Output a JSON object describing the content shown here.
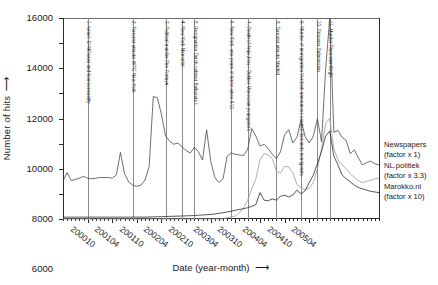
{
  "chart_data": {
    "type": "line",
    "title": "",
    "xlabel": "Date (year-month)",
    "ylabel": "Number of hits",
    "ylim": [
      0,
      16000
    ],
    "ytick_labels": [
      "0",
      "2000",
      "4000",
      "6000",
      "8000",
      "10000",
      "12000",
      "14000",
      "16000"
    ],
    "ytick_values": [
      0,
      2000,
      4000,
      6000,
      8000,
      10000,
      12000,
      14000,
      16000
    ],
    "grid": false,
    "legend_position": "right",
    "x_major_labels": [
      "200010",
      "200104",
      "200110",
      "200204",
      "200210",
      "200304",
      "200310",
      "200404",
      "200410",
      "200504"
    ],
    "x_range": [
      "200004",
      "200506"
    ],
    "series": [
      {
        "name": "Newspapers",
        "factor_label": "(factor x 1)",
        "color": "#4a4a4a",
        "values": [
          3000,
          3700,
          3050,
          3150,
          3250,
          3400,
          3250,
          3200,
          3250,
          3300,
          3300,
          3300,
          3250,
          3500,
          5300,
          3600,
          2950,
          2700,
          2600,
          2700,
          3100,
          4200,
          9750,
          9650,
          8300,
          6600,
          6200,
          5950,
          6050,
          5750,
          5450,
          5250,
          5700,
          5350,
          4700,
          7100,
          4600,
          3300,
          2900,
          3200,
          5000,
          5250,
          5150,
          5100,
          5050,
          5550,
          7200,
          6600,
          5800,
          5950,
          5600,
          5150,
          4800,
          5350,
          6700,
          7100,
          6050,
          6500,
          7900,
          6550,
          6050,
          6600,
          8000,
          6150,
          11950,
          16000,
          6900,
          7050,
          6500,
          6250,
          5200,
          5500,
          4850,
          4300,
          4500,
          4600,
          4400,
          4300
        ]
      },
      {
        "name": "NL.politiek",
        "factor_label": "(factor x 3.3)",
        "color": "#9b9b9b",
        "values": [
          0,
          0,
          0,
          0,
          0,
          0,
          0,
          0,
          0,
          0,
          0,
          0,
          0,
          0,
          0,
          0,
          0,
          0,
          0,
          0,
          0,
          0,
          0,
          0,
          0,
          0,
          0,
          0,
          0,
          0,
          0,
          0,
          0,
          0,
          0,
          0,
          0,
          0,
          0,
          0,
          100,
          150,
          250,
          500,
          900,
          1500,
          2400,
          3200,
          4700,
          5200,
          5100,
          4800,
          3800,
          3650,
          4200,
          4150,
          3700,
          2750,
          2500,
          2350,
          2450,
          2900,
          4000,
          5600,
          7600,
          8000,
          5600,
          4700,
          4300,
          4000,
          3600,
          3300,
          3050,
          2900,
          3000,
          3100,
          3200,
          3250
        ]
      },
      {
        "name": "Marokko.nl",
        "factor_label": "(factor x 10)",
        "color": "#2b2b2b",
        "values": [
          150,
          150,
          150,
          150,
          150,
          150,
          150,
          150,
          150,
          150,
          150,
          150,
          150,
          150,
          150,
          150,
          150,
          150,
          150,
          150,
          150,
          160,
          170,
          180,
          190,
          200,
          210,
          220,
          230,
          240,
          250,
          260,
          280,
          300,
          320,
          340,
          360,
          400,
          450,
          500,
          560,
          620,
          700,
          760,
          820,
          900,
          1000,
          1150,
          2100,
          1500,
          1450,
          1600,
          1500,
          1800,
          1900,
          1750,
          1900,
          2300,
          2000,
          2250,
          2900,
          3500,
          4400,
          5400,
          6600,
          7000,
          5000,
          4300,
          3500,
          3200,
          2950,
          2700,
          2500,
          2400,
          2300,
          2200,
          2150,
          2100
        ]
      }
    ],
    "events": [
      {
        "n": 1,
        "label": "1. Israel, El-MOsawi and homosexuality",
        "x_index": 6
      },
      {
        "n": 2,
        "label": "2. Terrorist attacks WTC New York",
        "x_index": 17
      },
      {
        "n": 3,
        "label": "3. Political murder Pim Fortuyn",
        "x_index": 25
      },
      {
        "n": 4,
        "label": "4. New York Memorial",
        "x_index": 29
      },
      {
        "n": 5,
        "label": "5. Resignation Dutch cabinet Balkende I",
        "x_index": 32
      },
      {
        "n": 6,
        "label": "6. New York, one years of terror since 9/11",
        "x_index": 41
      },
      {
        "n": 7,
        "label": "7. Death of Anja Joos / Dukker Moroccan youngsters",
        "x_index": 45
      },
      {
        "n": 8,
        "label": "8. Terrorist attacks Madrid",
        "x_index": 52
      },
      {
        "n": 9,
        "label": "9. Murder of immigration Verdonk announces service demands immigrants",
        "x_index": 58
      },
      {
        "n": 10,
        "label": "10. Prisoner Submission",
        "x_index": 62
      },
      {
        "n": 11,
        "label": "11. Murder Theo van Gogh",
        "x_index": 65
      }
    ],
    "legend_entries": [
      {
        "name": "Newspapers",
        "factor": "(factor x 1)"
      },
      {
        "name": "NL.politiek",
        "factor": "(factor x 3.3)"
      },
      {
        "name": "Marokko.nl",
        "factor": "(factor x 10)"
      }
    ]
  }
}
